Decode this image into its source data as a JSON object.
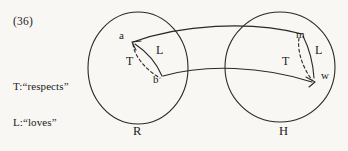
{
  "figure": {
    "example_number": "(36)",
    "legend": [
      "T:“respects”",
      "L:“loves”"
    ],
    "legend_lines": {
      "line1": "T:“respects”",
      "line2": "L:“loves”"
    },
    "sets": [
      {
        "id": "R",
        "label": "R",
        "role": "left-domain-circle"
      },
      {
        "id": "H",
        "label": "H",
        "role": "right-domain-circle"
      }
    ],
    "nodes": [
      {
        "id": "a",
        "label": "a",
        "set": "R"
      },
      {
        "id": "b",
        "label": "b",
        "set": "R"
      },
      {
        "id": "m",
        "label": "m",
        "set": "H"
      },
      {
        "id": "w",
        "label": "w",
        "set": "H"
      }
    ],
    "relations": [
      {
        "id": "T-left",
        "label": "T",
        "style": "dashed",
        "set": "R"
      },
      {
        "id": "L-left",
        "label": "L",
        "style": "solid",
        "set": "R"
      },
      {
        "id": "T-right",
        "label": "T",
        "style": "dashed",
        "set": "H"
      },
      {
        "id": "L-right",
        "label": "L",
        "style": "solid",
        "set": "H"
      }
    ],
    "connector": {
      "name": "band-between-sets",
      "description": "two curved lines joining the left circle region to the right circle region"
    },
    "colors": {
      "background": "#f8f7f4",
      "ink": "#1b1a18",
      "stroke": "#2a2926"
    }
  }
}
